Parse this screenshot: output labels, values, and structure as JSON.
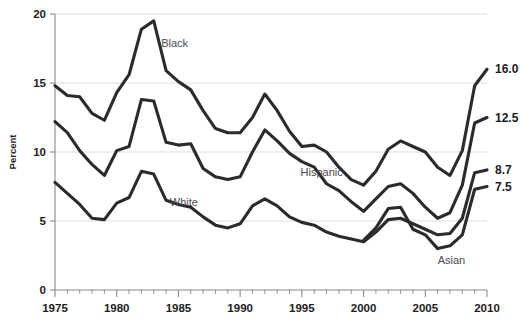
{
  "chart_data": {
    "type": "line",
    "title": "",
    "subtitle": "",
    "xlabel": "",
    "ylabel": "Percent",
    "xlim": [
      1975,
      2010
    ],
    "ylim": [
      0,
      20
    ],
    "y_ticks": [
      0,
      5,
      10,
      15,
      20
    ],
    "x_ticks": [
      1975,
      1980,
      1985,
      1990,
      1995,
      2000,
      2005,
      2010
    ],
    "x_minor_tick_interval": 1,
    "grid": "horizontal",
    "legend": "inline-annotations",
    "line_color": "#2b2b2b",
    "x": [
      1975,
      1976,
      1977,
      1978,
      1979,
      1980,
      1981,
      1982,
      1983,
      1984,
      1985,
      1986,
      1987,
      1988,
      1989,
      1990,
      1991,
      1992,
      1993,
      1994,
      1995,
      1996,
      1997,
      1998,
      1999,
      2000,
      2001,
      2002,
      2003,
      2004,
      2005,
      2006,
      2007,
      2008,
      2009,
      2010
    ],
    "series": [
      {
        "name": "Black",
        "label": "Black",
        "end_value_label": "16.0",
        "values": [
          14.8,
          14.1,
          14.0,
          12.8,
          12.3,
          14.3,
          15.6,
          18.9,
          19.5,
          15.9,
          15.1,
          14.5,
          13.0,
          11.7,
          11.4,
          11.4,
          12.5,
          14.2,
          13.0,
          11.5,
          10.4,
          10.5,
          10.0,
          8.9,
          8.0,
          7.6,
          8.6,
          10.2,
          10.8,
          10.4,
          10.0,
          8.9,
          8.3,
          10.1,
          14.8,
          16.0
        ]
      },
      {
        "name": "Hispanic",
        "label": "Hispanic",
        "end_value_label": "12.5",
        "values": [
          12.2,
          11.4,
          10.1,
          9.1,
          8.3,
          10.1,
          10.4,
          13.8,
          13.7,
          10.7,
          10.5,
          10.6,
          8.8,
          8.2,
          8.0,
          8.2,
          10.0,
          11.6,
          10.8,
          9.9,
          9.3,
          8.9,
          7.7,
          7.2,
          6.4,
          5.7,
          6.6,
          7.5,
          7.7,
          7.0,
          6.0,
          5.2,
          5.6,
          7.6,
          12.1,
          12.5
        ]
      },
      {
        "name": "White",
        "label": "White",
        "end_value_label": "8.7",
        "values": [
          7.8,
          7.0,
          6.2,
          5.2,
          5.1,
          6.3,
          6.7,
          8.6,
          8.4,
          6.5,
          6.2,
          6.0,
          5.3,
          4.7,
          4.5,
          4.8,
          6.1,
          6.6,
          6.1,
          5.3,
          4.9,
          4.7,
          4.2,
          3.9,
          3.7,
          3.5,
          4.2,
          5.1,
          5.2,
          4.8,
          4.4,
          4.0,
          4.1,
          5.2,
          8.5,
          8.7
        ]
      },
      {
        "name": "Asian",
        "label": "Asian",
        "end_value_label": "7.5",
        "values": [
          null,
          null,
          null,
          null,
          null,
          null,
          null,
          null,
          null,
          null,
          null,
          null,
          null,
          null,
          null,
          null,
          null,
          null,
          null,
          null,
          null,
          null,
          null,
          null,
          null,
          3.6,
          4.5,
          5.9,
          6.0,
          4.4,
          4.0,
          3.0,
          3.2,
          4.0,
          7.3,
          7.5
        ]
      }
    ],
    "annotations": [
      {
        "text": "Black",
        "x": 1983.6,
        "y": 17.6
      },
      {
        "text": "Hispanic",
        "x": 1994.9,
        "y": 8.25
      },
      {
        "text": "White",
        "x": 1984.3,
        "y": 6.1
      },
      {
        "text": "Asian",
        "x": 2006.0,
        "y": 1.85
      }
    ]
  }
}
